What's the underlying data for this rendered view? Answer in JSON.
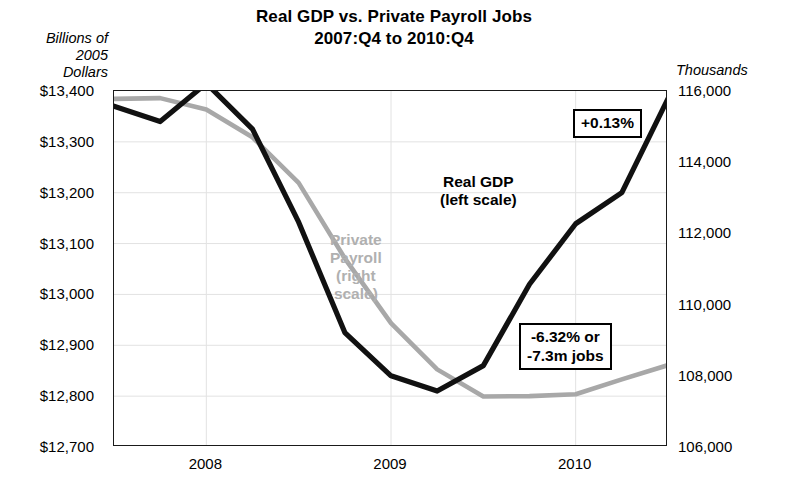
{
  "title": {
    "line1": "Real GDP vs. Private Payroll Jobs",
    "line2": "2007:Q4 to 2010:Q4"
  },
  "left_axis_header": "Billions of\n2005\nDollars",
  "left_axis_header_lines": [
    "Billions of",
    "2005",
    "Dollars"
  ],
  "right_axis_header": "Thousands",
  "labels": {
    "gdp_line1": "Real GDP",
    "gdp_line2": "(left scale)",
    "payroll_line1": "Private",
    "payroll_line2": "Payroll",
    "payroll_line3": "(right",
    "payroll_line4": "scale)"
  },
  "callouts": {
    "gdp": "+0.13%",
    "payroll_line1": "-6.32% or",
    "payroll_line2": "-7.3m jobs"
  },
  "colors": {
    "gdp": "#111111",
    "payroll": "#a8a8a8",
    "axis": "#1a1a1a",
    "grid": "#e2e2e2"
  },
  "chart_data": {
    "type": "line",
    "title": "Real GDP vs. Private Payroll Jobs 2007:Q4 to 2010:Q4",
    "xlabel": "",
    "ylabel": "Billions of 2005 Dollars",
    "y2label": "Thousands",
    "grid": true,
    "legend": "in-plot labels",
    "x": [
      "2007:Q4",
      "2008:Q1",
      "2008:Q2",
      "2008:Q3",
      "2008:Q4",
      "2009:Q1",
      "2009:Q2",
      "2009:Q3",
      "2009:Q4",
      "2010:Q1",
      "2010:Q2",
      "2010:Q3",
      "2010:Q4"
    ],
    "xtick_labels": [
      "2008",
      "2009",
      "2010"
    ],
    "xtick_positions": [
      "2008:Q2",
      "2009:Q2",
      "2010:Q2"
    ],
    "ylim": [
      12700,
      13400
    ],
    "ytick_labels": [
      "$13,400",
      "$13,300",
      "$13,200",
      "$13,100",
      "$13,000",
      "$12,900",
      "$12,800",
      "$12,700"
    ],
    "yticks": [
      13400,
      13300,
      13200,
      13100,
      13000,
      12900,
      12800,
      12700
    ],
    "y2lim": [
      106000,
      116000
    ],
    "y2tick_labels": [
      "116,000",
      "114,000",
      "112,000",
      "110,000",
      "108,000",
      "106,000"
    ],
    "y2ticks": [
      116000,
      114000,
      112000,
      110000,
      108000,
      106000
    ],
    "series": [
      {
        "name": "Real GDP (left scale)",
        "axis": "left",
        "color": "#111111",
        "values": [
          13370,
          13340,
          13415,
          13325,
          13142,
          12925,
          12840,
          12810,
          12860,
          13020,
          13139,
          13200,
          13385
        ]
      },
      {
        "name": "Private Payroll (right scale)",
        "axis": "right",
        "color": "#a8a8a8",
        "values": [
          115780,
          115800,
          115480,
          114700,
          113420,
          111300,
          109480,
          108180,
          107420,
          107430,
          107480,
          107900,
          108300
        ]
      }
    ],
    "annotations": [
      {
        "text": "+0.13%",
        "target": "Real GDP end",
        "note": "net change 2007:Q4 to 2010:Q4"
      },
      {
        "text": "-6.32% or -7.3m jobs",
        "target": "Private Payroll end",
        "note": "net change 2007:Q4 to 2010:Q4"
      }
    ]
  }
}
